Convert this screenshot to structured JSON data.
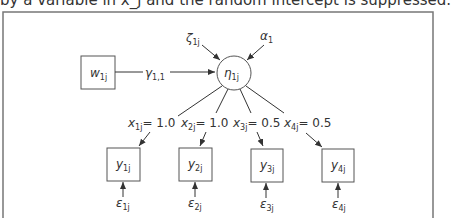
{
  "caption": "by a variable in x_j and the random intercept is suppressed.",
  "nodes": {
    "w": {
      "base": "w",
      "sub": "1j"
    },
    "eta": {
      "base": "η",
      "sub": "1j"
    },
    "zeta": {
      "base": "ζ",
      "sub": "1j"
    },
    "alpha": {
      "base": "α",
      "sub": "1"
    },
    "y": [
      {
        "base": "y",
        "sub": "1j"
      },
      {
        "base": "y",
        "sub": "2j"
      },
      {
        "base": "y",
        "sub": "3j"
      },
      {
        "base": "y",
        "sub": "4j"
      }
    ],
    "eps": [
      {
        "base": "ε",
        "sub": "1j"
      },
      {
        "base": "ε",
        "sub": "2j"
      },
      {
        "base": "ε",
        "sub": "3j"
      },
      {
        "base": "ε",
        "sub": "4j"
      }
    ]
  },
  "paths": {
    "gamma": {
      "base": "γ",
      "sub": "1,1"
    },
    "loadings": [
      {
        "base": "x",
        "sub": "1j",
        "value": "= 1.0"
      },
      {
        "base": "x",
        "sub": "2j",
        "value": "= 1.0"
      },
      {
        "base": "x",
        "sub": "3j",
        "value": "= 0.5"
      },
      {
        "base": "x",
        "sub": "4j",
        "value": "= 0.5"
      }
    ]
  }
}
